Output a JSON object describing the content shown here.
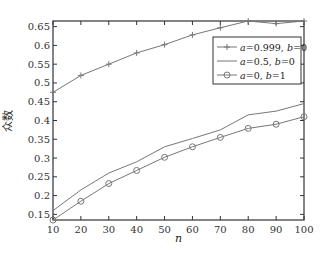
{
  "chart_data": {
    "type": "line",
    "title": "",
    "xlabel": "n",
    "ylabel": "众数",
    "xlim": [
      10,
      100
    ],
    "ylim": [
      0.135,
      0.665
    ],
    "grid": false,
    "legend_position": "upper right",
    "x": [
      10,
      20,
      30,
      40,
      50,
      60,
      70,
      80,
      90,
      100
    ],
    "x_ticks": [
      "10",
      "20",
      "30",
      "40",
      "50",
      "60",
      "70",
      "80",
      "90",
      "100"
    ],
    "y_ticks": [
      "0.15",
      "0.2",
      "0.25",
      "0.3",
      "0.35",
      "0.4",
      "0.45",
      "0.5",
      "0.55",
      "0.6",
      "0.65"
    ],
    "series": [
      {
        "name": "a=0.999, b=0",
        "marker": "plus",
        "values": [
          0.475,
          0.52,
          0.55,
          0.58,
          0.602,
          0.628,
          0.647,
          0.665,
          0.658,
          0.665
        ]
      },
      {
        "name": "a=0.5, b=0",
        "marker": "none",
        "values": [
          0.16,
          0.215,
          0.26,
          0.29,
          0.33,
          0.352,
          0.375,
          0.415,
          0.425,
          0.445
        ]
      },
      {
        "name": "a=0, b=1",
        "marker": "circle",
        "values": [
          0.135,
          0.185,
          0.232,
          0.267,
          0.302,
          0.33,
          0.355,
          0.379,
          0.39,
          0.41
        ]
      }
    ]
  },
  "legend": {
    "items": [
      {
        "a": "a",
        "eq1": "=0.999, ",
        "b": "b",
        "eq2": "=0"
      },
      {
        "a": "a",
        "eq1": "=0.5, ",
        "b": "b",
        "eq2": "=0"
      },
      {
        "a": "a",
        "eq1": "=0, ",
        "b": "b",
        "eq2": "=1"
      }
    ]
  },
  "colors": {
    "line": "#777777",
    "axis": "#333333"
  }
}
